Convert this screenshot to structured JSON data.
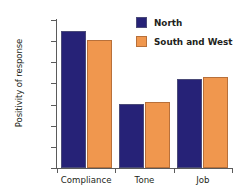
{
  "chart_data": {
    "type": "bar",
    "title": "",
    "xlabel": "",
    "ylabel": "Positivity of response",
    "categories": [
      "Compliance",
      "Tone",
      "Job"
    ],
    "series": [
      {
        "name": "North",
        "color": "#262277",
        "values": [
          3.25,
          1.51,
          2.1
        ]
      },
      {
        "name": "South and West",
        "color": "#f0974e",
        "values": [
          3.02,
          1.56,
          2.16
        ]
      }
    ],
    "ylim": [
      0,
      3.5
    ],
    "yticks": [
      "0",
      "0.5",
      "1",
      "1.5",
      "2",
      "2.5",
      "3",
      "3.5"
    ],
    "ytick_values": [
      0,
      0.5,
      1,
      1.5,
      2,
      2.5,
      3,
      3.5
    ],
    "grid": false,
    "legend_position": "top-right"
  },
  "legend": {
    "entries": [
      {
        "label": "North",
        "color": "#262277"
      },
      {
        "label": "South and West",
        "color": "#f0974e"
      }
    ]
  }
}
